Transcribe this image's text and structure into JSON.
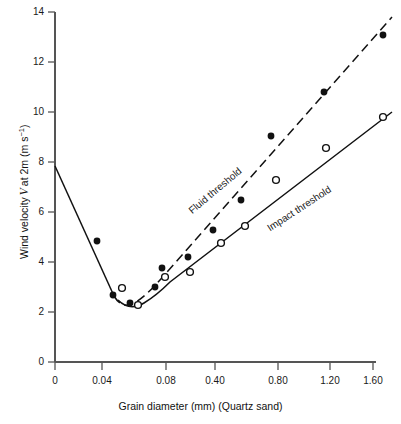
{
  "chart_data": {
    "type": "scatter",
    "title": "",
    "xlabel": "Grain diameter (mm)  (Quartz sand)",
    "ylabel": "Wind velocity V at 2m (m s⁻¹)",
    "xtick_labels": [
      "0",
      "0.04",
      "0.08",
      "0.40",
      "0.80",
      "1.20",
      "1.60"
    ],
    "xtick_values": [
      0,
      0.04,
      0.08,
      0.4,
      0.8,
      1.2,
      1.6
    ],
    "xtick_px": [
      55,
      102,
      166,
      215,
      278,
      330,
      373
    ],
    "ytick_labels": [
      "0",
      "2",
      "4",
      "6",
      "8",
      "10",
      "12",
      "14"
    ],
    "ytick_values": [
      0,
      2,
      4,
      6,
      8,
      10,
      12,
      14
    ],
    "ylim": [
      0,
      14
    ],
    "grid": false,
    "legend_position": "inline-curve-labels",
    "annotations": [
      {
        "text": "Fluid threshold",
        "x_px": 215,
        "y_px": 192,
        "rotation_deg": -40
      },
      {
        "text": "Impact threshold",
        "x_px": 299,
        "y_px": 210,
        "rotation_deg": -33
      }
    ],
    "series": [
      {
        "name": "Fluid threshold",
        "marker": "filled-circle",
        "line_style": "dashed",
        "points": [
          {
            "x": 0.037,
            "y": 5.05,
            "px": 97,
            "py": 241
          },
          {
            "x": 0.051,
            "y": 3.05,
            "px": 113,
            "py": 295
          },
          {
            "x": 0.063,
            "y": 2.8,
            "px": 130,
            "py": 303
          },
          {
            "x": 0.078,
            "y": 3.45,
            "px": 155,
            "py": 287
          },
          {
            "x": 0.085,
            "y": 4.2,
            "px": 162,
            "py": 268
          },
          {
            "x": 0.175,
            "y": 4.5,
            "px": 188,
            "py": 257
          },
          {
            "x": 0.33,
            "y": 5.5,
            "px": 213,
            "py": 230
          },
          {
            "x": 0.52,
            "y": 6.75,
            "px": 241,
            "py": 200
          },
          {
            "x": 0.79,
            "y": 9.2,
            "px": 271,
            "py": 136
          },
          {
            "x": 1.15,
            "y": 10.8,
            "px": 324,
            "py": 92
          },
          {
            "x": 1.62,
            "y": 12.95,
            "px": 383,
            "py": 35
          }
        ]
      },
      {
        "name": "Impact threshold",
        "marker": "open-circle",
        "line_style": "solid",
        "points": [
          {
            "x": 0.057,
            "y": 3.25,
            "px": 122,
            "py": 288
          },
          {
            "x": 0.068,
            "y": 2.75,
            "px": 138,
            "py": 305
          },
          {
            "x": 0.082,
            "y": 3.7,
            "px": 165,
            "py": 277
          },
          {
            "x": 0.19,
            "y": 3.9,
            "px": 190,
            "py": 272
          },
          {
            "x": 0.4,
            "y": 5.0,
            "px": 221,
            "py": 243
          },
          {
            "x": 0.56,
            "y": 5.75,
            "px": 245,
            "py": 226
          },
          {
            "x": 0.81,
            "y": 7.4,
            "px": 276,
            "py": 180
          },
          {
            "x": 1.17,
            "y": 8.65,
            "px": 326,
            "py": 148
          },
          {
            "x": 1.62,
            "y": 9.95,
            "px": 383,
            "py": 117
          }
        ]
      },
      {
        "name": "Descending common branch",
        "marker": "none",
        "line_style": "solid",
        "points": [
          {
            "x": 0.0,
            "y": 8.0,
            "px": 55,
            "py": 166
          },
          {
            "x": 0.037,
            "y": 5.05,
            "px": 97,
            "py": 241
          },
          {
            "x": 0.051,
            "y": 3.05,
            "px": 114,
            "py": 296
          }
        ]
      }
    ],
    "colors": {
      "ink": "#1a1a1a",
      "axis": "#555555",
      "background": "#ffffff"
    }
  }
}
